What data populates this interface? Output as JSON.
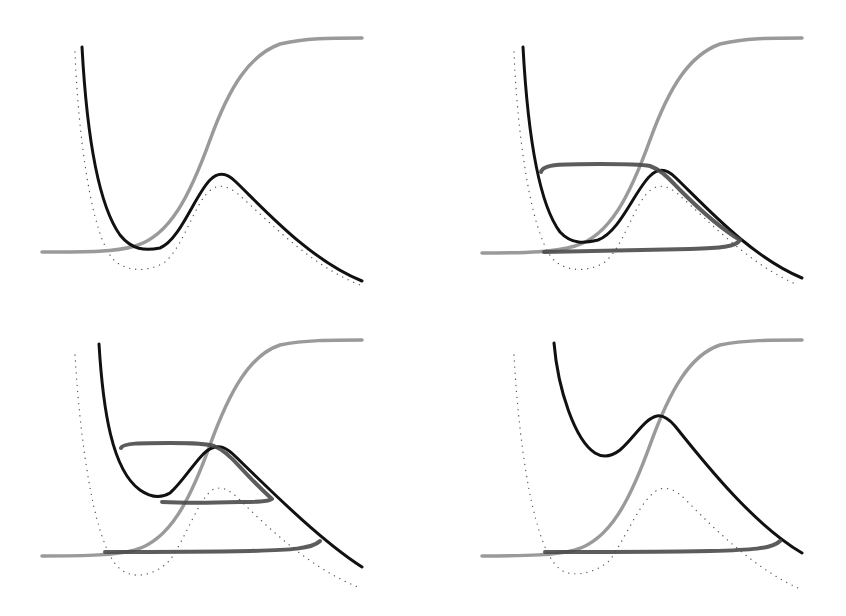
{
  "figure": {
    "title": "",
    "layout": "2x2 grid of panels",
    "colors": {
      "background": "#ffffff",
      "potential_curve": "#111111",
      "reference_curve_dotted": "#555555",
      "sigmoid_curve": "#9a9a9a",
      "hysteresis_loop": "#4a4a4a"
    },
    "stroke_widths": {
      "potential_curve": 3,
      "reference_curve_dotted": 1.3,
      "sigmoid_curve": 3.5,
      "hysteresis_loop": 4
    },
    "panels": [
      {
        "id": "panel-top-left",
        "label": "",
        "sigmoid": "M42,252 C90,252 115,252 135,246 C170,236 190,195 210,140 C230,85 250,55 280,44 C305,38 330,38 362,38",
        "potential": "M82,47 C86,120 95,200 120,235 C132,250 145,251 160,248 C180,240 195,195 210,180 C218,172 226,172 236,182 C265,210 310,260 362,281",
        "dotted": "M75,52 C78,130 90,230 112,258 C125,273 150,272 165,262 C185,245 195,200 212,189 C220,184 228,186 238,194 C270,222 310,265 360,285",
        "loops": []
      },
      {
        "id": "panel-top-right",
        "label": "",
        "sigmoid": "M482,253 C530,253 555,252 575,246 C610,236 630,195 650,140 C670,85 690,55 720,44 C745,38 770,38 802,38",
        "potential": "M523,47 C527,120 536,200 560,232 C572,245 585,243 598,240 C620,232 635,190 650,176 C658,168 666,168 676,178 C705,206 750,256 802,278",
        "dotted": "M514,52 C517,130 530,230 552,258 C565,273 590,272 605,262 C625,245 635,200 652,189 C660,184 668,186 678,194 C710,222 750,265 798,285",
        "loops": [
          "M541,172 C543,164 560,164 600,164 C625,164 640,164 650,166 C662,170 670,180 680,190 C700,210 720,228 740,240 C736,247 720,248 690,249 C640,250 590,251 544,252"
        ]
      },
      {
        "id": "panel-bottom-left",
        "label": "",
        "sigmoid": "M42,556 C90,556 115,555 135,550 C170,540 190,500 210,445 C230,390 250,355 280,345 C305,340 330,340 362,340",
        "potential": "M99,344 C103,410 112,470 140,490 C150,497 160,499 170,493 C185,480 200,452 212,448 C220,445 226,447 236,457 C270,490 320,540 362,567",
        "dotted": "M75,355 C80,440 95,560 125,572 C135,578 155,576 170,560 C185,540 200,495 214,489 C222,486 230,490 240,500 C275,535 315,570 358,587",
        "loops": [
          "M121,448 C123,443 140,443 170,443 C190,443 205,443 214,446 C224,450 232,458 240,467 C252,480 262,490 272,499 C268,502 255,502 240,502 C210,503 180,503 162,502",
          "M105,552 C150,552 200,552 250,551 C290,550 312,549 320,541"
        ]
      },
      {
        "id": "panel-bottom-right",
        "label": "",
        "sigmoid": "M482,556 C530,556 555,555 575,550 C610,540 630,500 650,445 C670,390 690,355 720,345 C745,340 770,340 802,340",
        "potential": "M554,343 C558,390 575,440 595,453 C603,458 611,457 620,450 C634,438 645,418 657,416 C663,415 668,418 675,426 C710,470 755,525 802,553",
        "dotted": "M514,355 C518,430 532,560 565,572 C575,576 595,574 610,560 C625,540 642,495 660,489 C668,487 676,490 686,500 C720,535 758,570 798,588",
        "loops": [
          "M545,552 C600,552 660,552 710,551 C750,550 772,549 780,541"
        ]
      }
    ]
  }
}
